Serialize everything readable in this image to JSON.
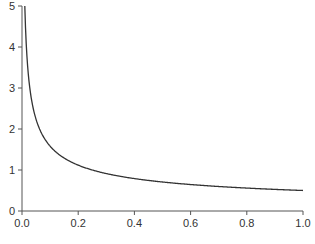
{
  "chart_data": {
    "type": "line",
    "title": "",
    "xlabel": "",
    "ylabel": "",
    "xlim": [
      0.0,
      1.0
    ],
    "ylim": [
      0,
      5
    ],
    "grid": false,
    "legend": null,
    "x_ticks": [
      "0.0",
      "0.2",
      "0.4",
      "0.6",
      "0.8",
      "1.0"
    ],
    "y_ticks": [
      "0",
      "1",
      "2",
      "3",
      "4",
      "5"
    ],
    "series": [
      {
        "name": "curve",
        "color": "#333333",
        "x": [
          0.01,
          0.02,
          0.03,
          0.05,
          0.075,
          0.1,
          0.15,
          0.2,
          0.3,
          0.4,
          0.5,
          0.6,
          0.7,
          0.8,
          0.9,
          1.0
        ],
        "values": [
          5.0,
          3.54,
          2.89,
          2.24,
          1.83,
          1.58,
          1.29,
          1.12,
          0.91,
          0.79,
          0.71,
          0.65,
          0.6,
          0.56,
          0.53,
          0.5
        ]
      }
    ]
  }
}
